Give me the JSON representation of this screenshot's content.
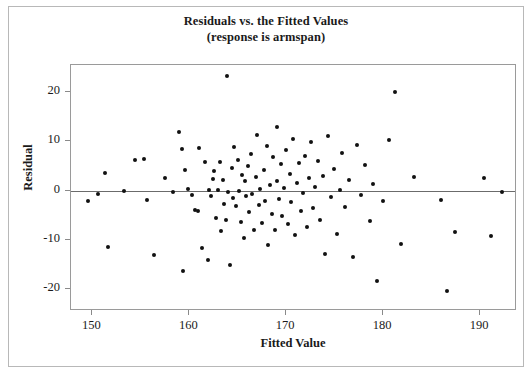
{
  "chart_data": {
    "type": "scatter",
    "title": "Residuals vs. the Fitted Values",
    "subtitle": "(response is armspan)",
    "xlabel": "Fitted Value",
    "ylabel": "Residual",
    "xlim": [
      147.8,
      193.6
    ],
    "ylim": [
      -24.0,
      25.5
    ],
    "xticks": [
      150,
      160,
      170,
      180,
      190
    ],
    "yticks": [
      20,
      10,
      0,
      -10,
      -20
    ],
    "grid": false,
    "legend": null,
    "reference_line": {
      "axis": "y",
      "value": 0
    },
    "points": [
      [
        149.6,
        -2.1
      ],
      [
        150.6,
        -0.6
      ],
      [
        151.3,
        3.6
      ],
      [
        151.6,
        -11.5
      ],
      [
        153.3,
        0.0
      ],
      [
        154.4,
        6.3
      ],
      [
        155.3,
        6.4
      ],
      [
        155.6,
        -1.9
      ],
      [
        156.4,
        -13.0
      ],
      [
        157.5,
        2.5
      ],
      [
        158.3,
        -0.2
      ],
      [
        158.9,
        11.9
      ],
      [
        159.2,
        8.4
      ],
      [
        159.4,
        -16.3
      ],
      [
        159.6,
        4.2
      ],
      [
        159.9,
        0.3
      ],
      [
        160.3,
        -0.8
      ],
      [
        160.6,
        -4.0
      ],
      [
        160.9,
        -4.1
      ],
      [
        161.0,
        8.6
      ],
      [
        161.3,
        -11.7
      ],
      [
        161.6,
        5.8
      ],
      [
        161.9,
        -14.1
      ],
      [
        162.0,
        0.2
      ],
      [
        162.2,
        -1.1
      ],
      [
        162.4,
        2.3
      ],
      [
        162.6,
        3.9
      ],
      [
        162.8,
        -5.6
      ],
      [
        163.0,
        0.1
      ],
      [
        163.2,
        5.9
      ],
      [
        163.3,
        -8.2
      ],
      [
        163.5,
        2.1
      ],
      [
        163.6,
        -2.6
      ],
      [
        163.8,
        -6.0
      ],
      [
        163.9,
        23.2
      ],
      [
        164.0,
        -0.2
      ],
      [
        164.2,
        -15.0
      ],
      [
        164.4,
        4.6
      ],
      [
        164.5,
        -1.4
      ],
      [
        164.6,
        8.8
      ],
      [
        164.8,
        -3.1
      ],
      [
        165.0,
        6.2
      ],
      [
        165.1,
        0.0
      ],
      [
        165.3,
        -6.4
      ],
      [
        165.4,
        3.2
      ],
      [
        165.6,
        -9.5
      ],
      [
        165.8,
        1.9
      ],
      [
        165.9,
        -1.0
      ],
      [
        166.1,
        5.0
      ],
      [
        166.2,
        -4.4
      ],
      [
        166.4,
        7.4
      ],
      [
        166.5,
        -0.6
      ],
      [
        166.7,
        -8.0
      ],
      [
        166.9,
        2.8
      ],
      [
        167.0,
        11.2
      ],
      [
        167.2,
        -3.0
      ],
      [
        167.3,
        0.4
      ],
      [
        167.5,
        -6.6
      ],
      [
        167.7,
        4.1
      ],
      [
        167.8,
        -2.0
      ],
      [
        168.0,
        9.0
      ],
      [
        168.1,
        -11.0
      ],
      [
        168.3,
        1.1
      ],
      [
        168.5,
        -4.8
      ],
      [
        168.6,
        6.8
      ],
      [
        168.8,
        -7.9
      ],
      [
        169.0,
        2.0
      ],
      [
        169.1,
        13.0
      ],
      [
        169.3,
        -1.6
      ],
      [
        169.5,
        5.4
      ],
      [
        169.6,
        -5.2
      ],
      [
        169.8,
        0.6
      ],
      [
        170.0,
        8.2
      ],
      [
        170.2,
        -6.8
      ],
      [
        170.4,
        3.4
      ],
      [
        170.5,
        -2.3
      ],
      [
        170.7,
        10.5
      ],
      [
        170.9,
        -9.0
      ],
      [
        171.1,
        1.5
      ],
      [
        171.3,
        5.6
      ],
      [
        171.5,
        -4.2
      ],
      [
        171.7,
        -0.4
      ],
      [
        171.9,
        7.0
      ],
      [
        172.1,
        -7.3
      ],
      [
        172.4,
        2.6
      ],
      [
        172.6,
        9.8
      ],
      [
        172.8,
        -3.6
      ],
      [
        173.0,
        0.8
      ],
      [
        173.3,
        6.0
      ],
      [
        173.5,
        -5.9
      ],
      [
        173.8,
        3.0
      ],
      [
        174.0,
        -12.8
      ],
      [
        174.3,
        11.0
      ],
      [
        174.6,
        -1.2
      ],
      [
        174.9,
        4.4
      ],
      [
        175.2,
        -8.7
      ],
      [
        175.5,
        0.2
      ],
      [
        175.8,
        7.6
      ],
      [
        176.1,
        -3.4
      ],
      [
        176.5,
        2.2
      ],
      [
        176.9,
        -13.5
      ],
      [
        177.3,
        9.2
      ],
      [
        177.7,
        -0.9
      ],
      [
        178.1,
        5.2
      ],
      [
        178.6,
        -6.2
      ],
      [
        179.0,
        1.3
      ],
      [
        179.4,
        -18.3
      ],
      [
        180.0,
        -2.0
      ],
      [
        180.6,
        10.2
      ],
      [
        181.2,
        20.0
      ],
      [
        181.8,
        -10.8
      ],
      [
        183.2,
        2.7
      ],
      [
        186.0,
        -1.8
      ],
      [
        186.6,
        -20.4
      ],
      [
        187.4,
        -8.4
      ],
      [
        190.4,
        2.5
      ],
      [
        191.1,
        -9.2
      ],
      [
        192.3,
        -0.3
      ]
    ]
  }
}
